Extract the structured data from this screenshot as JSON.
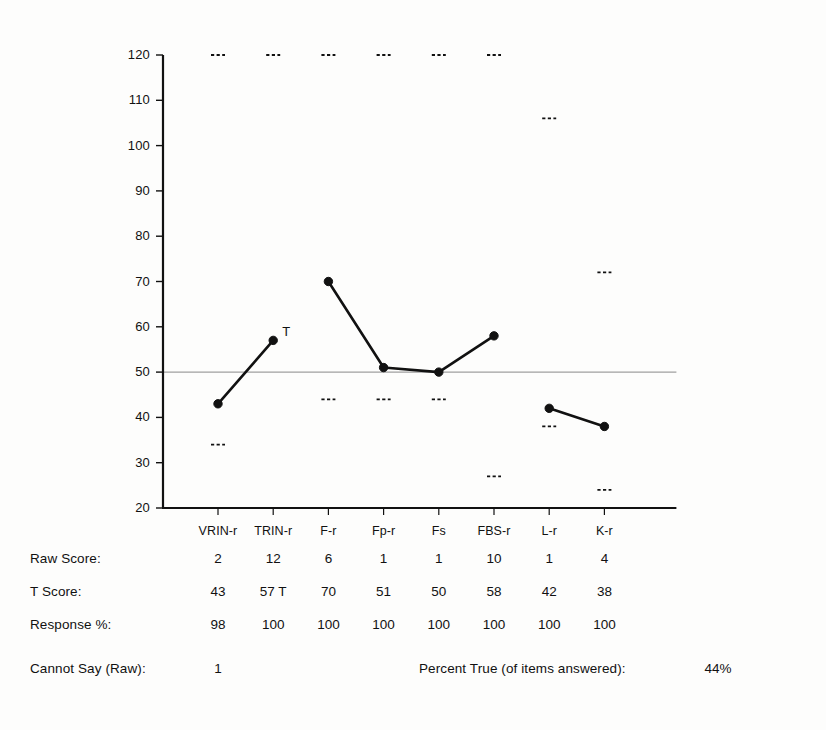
{
  "chart_data": {
    "type": "line",
    "xlabel": "",
    "ylabel": "T Score",
    "ylim": [
      20,
      120
    ],
    "ytick_step": 10,
    "yticks": [
      120,
      110,
      100,
      90,
      80,
      70,
      60,
      50,
      40,
      30,
      20
    ],
    "categories": [
      "VRIN-r",
      "TRIN-r",
      "F-r",
      "Fp-r",
      "Fs",
      "FBS-r",
      "L-r",
      "K-r"
    ],
    "values": [
      43,
      57,
      70,
      51,
      50,
      58,
      42,
      38
    ],
    "reference_line": 50,
    "grid": false,
    "legend": "none",
    "line_segments": [
      [
        0,
        1
      ],
      [
        2,
        3,
        4,
        5
      ],
      [
        6,
        7
      ]
    ],
    "marker": "filled-circle",
    "annotations": [
      {
        "category": "TRIN-r",
        "value": 57,
        "text": "T"
      }
    ],
    "confidence_markers_upper": [
      120,
      120,
      120,
      120,
      120,
      120,
      106,
      72
    ],
    "confidence_markers_lower": [
      34,
      null,
      44,
      44,
      44,
      27,
      38,
      24
    ],
    "series": [
      {
        "name": "T Score",
        "values": [
          43,
          57,
          70,
          51,
          50,
          58,
          42,
          38
        ]
      }
    ]
  },
  "table": {
    "row_labels": [
      "Raw Score:",
      "T Score:",
      "Response %:"
    ],
    "rows": [
      {
        "label": "Raw Score:",
        "cells": [
          "2",
          "12",
          "6",
          "1",
          "1",
          "10",
          "1",
          "4"
        ]
      },
      {
        "label": "T Score:",
        "cells": [
          "43",
          "57 T",
          "70",
          "51",
          "50",
          "58",
          "42",
          "38"
        ]
      },
      {
        "label": "Response %:",
        "cells": [
          "98",
          "100",
          "100",
          "100",
          "100",
          "100",
          "100",
          "100"
        ]
      }
    ]
  },
  "footer": {
    "cannot_say_label": "Cannot Say (Raw):",
    "cannot_say_value": "1",
    "percent_true_label": "Percent True (of items answered):",
    "percent_true_value": "44%"
  },
  "colors": {
    "ink": "#111111",
    "reference_line": "#888888",
    "paper": "#fdfdfc"
  }
}
